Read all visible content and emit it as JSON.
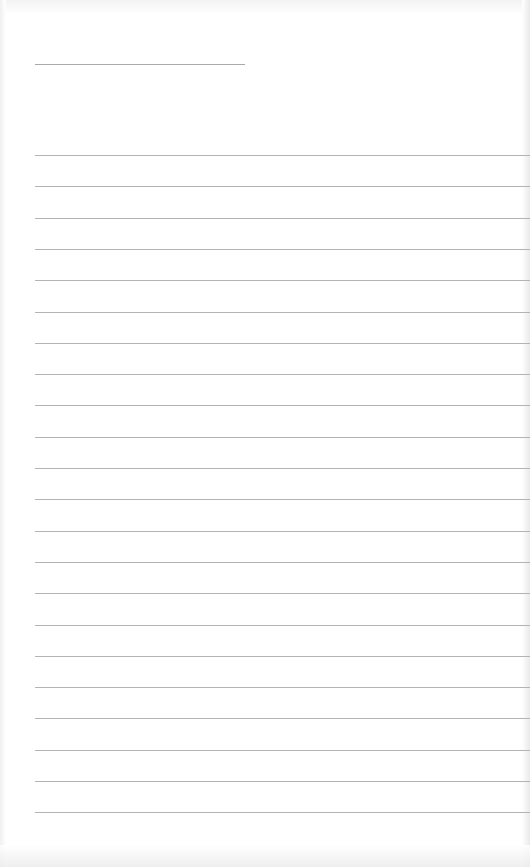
{
  "document": {
    "type": "lined-writing-sheet",
    "name_line": {
      "label": "",
      "value": ""
    },
    "lines": [
      {
        "value": ""
      },
      {
        "value": ""
      },
      {
        "value": ""
      },
      {
        "value": ""
      },
      {
        "value": ""
      },
      {
        "value": ""
      },
      {
        "value": ""
      },
      {
        "value": ""
      },
      {
        "value": ""
      },
      {
        "value": ""
      },
      {
        "value": ""
      },
      {
        "value": ""
      },
      {
        "value": ""
      },
      {
        "value": ""
      },
      {
        "value": ""
      },
      {
        "value": ""
      },
      {
        "value": ""
      },
      {
        "value": ""
      },
      {
        "value": ""
      },
      {
        "value": ""
      },
      {
        "value": ""
      },
      {
        "value": ""
      }
    ],
    "line_count": 22,
    "line_spacing_px": 31.3,
    "colors": {
      "paper": "#ffffff",
      "rule": "#b3b3b3",
      "short_rule": "#a9a9a9"
    }
  }
}
